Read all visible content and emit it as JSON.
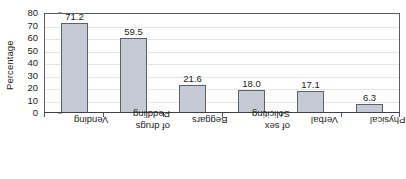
{
  "chart_data": {
    "type": "bar",
    "title": "",
    "xlabel": "",
    "ylabel": "Percentage",
    "ylim": [
      0,
      80
    ],
    "grid": true,
    "legend": false,
    "categories": [
      "Vending",
      "Peddling of drugs",
      "Beggars",
      "Soliciting of sex",
      "Verbal",
      "Physical"
    ],
    "category_lines": [
      [
        "Vending"
      ],
      [
        "Peddling",
        "of drugs"
      ],
      [
        "Beggars"
      ],
      [
        "Soliciting",
        "of sex"
      ],
      [
        "Verbal"
      ],
      [
        "Physical"
      ]
    ],
    "values": [
      71.2,
      59.5,
      21.6,
      18.0,
      17.1,
      6.3
    ],
    "value_labels": [
      "71.2",
      "59.5",
      "21.6",
      "18.0",
      "17.1",
      "6.3"
    ],
    "y_ticks": [
      0,
      10,
      20,
      30,
      40,
      50,
      60,
      70,
      80
    ],
    "y_tick_labels": [
      "0",
      "10",
      "20",
      "30",
      "40",
      "50",
      "60",
      "70",
      "80"
    ],
    "colors": {
      "bar_fill": "#c6cad4",
      "bar_stroke": "#5c6069",
      "axis": "#52575e",
      "gridline": "#e3e5e8",
      "text": "#1b1b1b",
      "background": "#ffffff"
    }
  }
}
